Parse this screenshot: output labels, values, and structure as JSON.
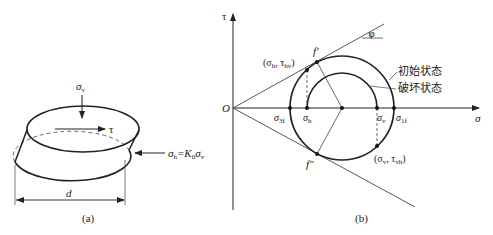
{
  "figure_a": {
    "caption": "(a)",
    "vertical_stress_label": "σ",
    "vertical_stress_sub": "v",
    "shear_label": "τ",
    "horizontal_stress_label_main": "σ",
    "horizontal_stress_label_sub": "h",
    "horizontal_stress_eq": "=K",
    "horizontal_stress_k_sub": "0",
    "horizontal_stress_sigma": "σ",
    "horizontal_stress_sigma_sub": "v",
    "diameter_label": "d"
  },
  "figure_b": {
    "caption": "(b)",
    "axis_y_label": "τ",
    "axis_x_label": "σ",
    "origin_label": "O",
    "angle_label": "φ",
    "point_f_prime": "f′",
    "point_f_double_prime": "f″",
    "point_h_label": "(σ",
    "point_h_sub1": "h",
    "point_h_mid": ", τ",
    "point_h_sub2": "hv",
    "point_h_end": ")",
    "point_v_label": "(σ",
    "point_v_sub1": "v",
    "point_v_mid": ", τ",
    "point_v_sub2": "vh",
    "point_v_end": ")",
    "tick_sigma3f": "σ",
    "tick_sigma3f_sub": "3f",
    "tick_sigmah": "σ",
    "tick_sigmah_sub": "h",
    "tick_sigmav": "σ",
    "tick_sigmav_sub": "v",
    "tick_sigma1f": "σ",
    "tick_sigma1f_sub": "1f",
    "legend_initial": "初始状态",
    "legend_failure": "破坏状态"
  }
}
